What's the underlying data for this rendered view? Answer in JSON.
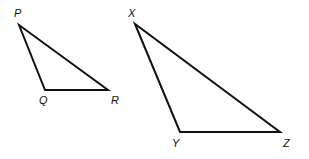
{
  "diagram": {
    "stroke_color": "#111111",
    "triangles": [
      {
        "name": "PQR",
        "vertices": [
          {
            "label": "P",
            "x": 19,
            "y": 25,
            "lx": 14,
            "ly": 17
          },
          {
            "label": "Q",
            "x": 45,
            "y": 90,
            "lx": 39,
            "ly": 104
          },
          {
            "label": "R",
            "x": 108,
            "y": 90,
            "lx": 111,
            "ly": 104
          }
        ]
      },
      {
        "name": "XYZ",
        "vertices": [
          {
            "label": "X",
            "x": 135,
            "y": 24,
            "lx": 128,
            "ly": 17
          },
          {
            "label": "Y",
            "x": 180,
            "y": 132,
            "lx": 172,
            "ly": 147
          },
          {
            "label": "Z",
            "x": 280,
            "y": 132,
            "lx": 283,
            "ly": 147
          }
        ]
      }
    ]
  }
}
